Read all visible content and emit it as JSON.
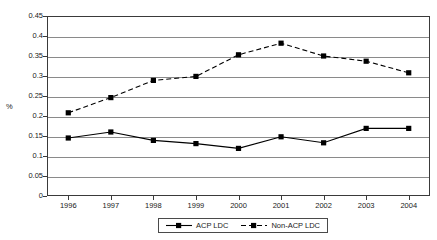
{
  "chart_data": {
    "type": "line",
    "title": "",
    "subtitle": "",
    "xlabel": "",
    "ylabel": "%",
    "categories": [
      "1996",
      "1997",
      "1998",
      "1999",
      "2000",
      "2001",
      "2002",
      "2003",
      "2004"
    ],
    "x": [
      1996,
      1997,
      1998,
      1999,
      2000,
      2001,
      2002,
      2003,
      2004
    ],
    "series": [
      {
        "name": "ACP LDC",
        "values": [
          0.145,
          0.16,
          0.139,
          0.131,
          0.119,
          0.148,
          0.133,
          0.169,
          0.169
        ],
        "line_style": "solid",
        "marker": "filled-square",
        "color": "#000000"
      },
      {
        "name": "Non-ACP LDC",
        "values": [
          0.208,
          0.246,
          0.289,
          0.299,
          0.353,
          0.382,
          0.35,
          0.337,
          0.308
        ],
        "line_style": "dashed",
        "marker": "filled-square",
        "color": "#000000"
      }
    ],
    "ylim": [
      0,
      0.45
    ],
    "yticks": [
      0,
      0.05,
      0.1,
      0.15,
      0.2,
      0.25,
      0.3,
      0.35,
      0.4,
      0.45
    ],
    "ytick_labels": [
      "0",
      "0.05",
      "0.1",
      "0.15",
      "0.2",
      "0.25",
      "0.3",
      "0.35",
      "0.4",
      "0.45"
    ],
    "grid": true,
    "grid_axis": "y",
    "legend_position": "bottom",
    "legend_entries": [
      "ACP LDC",
      "Non-ACP LDC"
    ],
    "colors": {
      "axis": "#3a3a3a",
      "grid": "#8a8a8a",
      "series": "#000000",
      "background": "#ffffff"
    }
  }
}
